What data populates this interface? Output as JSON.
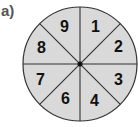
{
  "label": "a)",
  "spinner": {
    "sections": [
      "1",
      "2",
      "3",
      "4",
      "6",
      "7",
      "8",
      "9"
    ],
    "section_count": 8,
    "fill_color": "#d9d9d9",
    "line_color": "#333333"
  }
}
